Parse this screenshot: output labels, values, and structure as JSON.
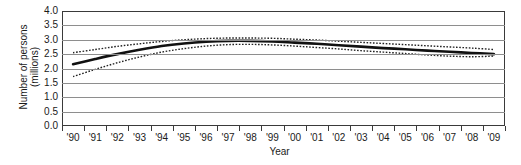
{
  "chart_data": {
    "type": "line",
    "title": "",
    "xlabel": "Year",
    "ylabel_lines": [
      "Number of persons",
      "(millions)"
    ],
    "ylabel": "Number of persons (millions)",
    "ylim": [
      0.0,
      4.0
    ],
    "yticks": [
      "4.0",
      "3.5",
      "3.0",
      "2.5",
      "2.0",
      "1.5",
      "1.0",
      "0.5",
      "0.0"
    ],
    "ytick_values": [
      4.0,
      3.5,
      3.0,
      2.5,
      2.0,
      1.5,
      1.0,
      0.5,
      0.0
    ],
    "grid": true,
    "legend": "none",
    "categories": [
      "'90",
      "'91",
      "'92",
      "'93",
      "'94",
      "'95",
      "'96",
      "'97",
      "'98",
      "'99",
      "'00",
      "'01",
      "'02",
      "'03",
      "'04",
      "'05",
      "'06",
      "'07",
      "'08",
      "'09"
    ],
    "x": [
      1990,
      1991,
      1992,
      1993,
      1994,
      1995,
      1996,
      1997,
      1998,
      1999,
      2000,
      2001,
      2002,
      2003,
      2004,
      2005,
      2006,
      2007,
      2008,
      2009
    ],
    "series": [
      {
        "name": "Estimate",
        "style": "solid",
        "values": [
          2.15,
          2.33,
          2.5,
          2.65,
          2.78,
          2.87,
          2.93,
          2.96,
          2.96,
          2.94,
          2.9,
          2.86,
          2.81,
          2.76,
          2.71,
          2.67,
          2.62,
          2.58,
          2.54,
          2.5
        ]
      },
      {
        "name": "Upper confidence limit",
        "style": "dotted",
        "values": [
          2.55,
          2.66,
          2.77,
          2.86,
          2.94,
          3.0,
          3.04,
          3.06,
          3.06,
          3.05,
          3.02,
          2.99,
          2.95,
          2.91,
          2.87,
          2.83,
          2.79,
          2.75,
          2.71,
          2.66
        ]
      },
      {
        "name": "Lower confidence limit",
        "style": "dotted",
        "values": [
          1.72,
          1.97,
          2.2,
          2.4,
          2.57,
          2.69,
          2.78,
          2.83,
          2.84,
          2.82,
          2.78,
          2.73,
          2.68,
          2.62,
          2.57,
          2.52,
          2.47,
          2.43,
          2.41,
          2.43
        ]
      }
    ],
    "colors": {
      "line": "#111111",
      "band": "#222222",
      "grid": "#8e8e8e",
      "axis": "#3a3a3a",
      "background": "#ffffff"
    }
  }
}
